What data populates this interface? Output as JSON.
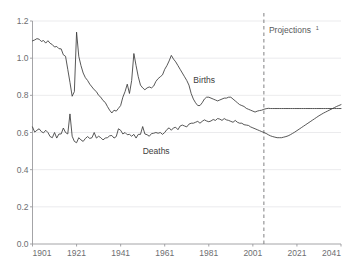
{
  "chart_data": {
    "type": "line",
    "title": "",
    "xlabel": "",
    "ylabel": "",
    "xlim": [
      1901,
      2041
    ],
    "ylim": [
      0.0,
      1.2
    ],
    "grid": true,
    "legend": "inline-labels",
    "x_ticks": [
      "1901",
      "1921",
      "1941",
      "1961",
      "1981",
      "2001",
      "2021",
      "2041"
    ],
    "x_tick_values": [
      1901,
      1921,
      1941,
      1961,
      1981,
      2001,
      2021,
      2041
    ],
    "y_ticks": [
      "0.0",
      "0.2",
      "0.4",
      "0.6",
      "0.8",
      "1.0",
      "1.2"
    ],
    "y_tick_values": [
      0.0,
      0.2,
      0.4,
      0.6,
      0.8,
      1.0,
      1.2
    ],
    "annotations": [
      {
        "name": "projection-divider",
        "label": "Projections",
        "superscript": "1",
        "x_value": 2006,
        "style": "dashed-vertical"
      }
    ],
    "series": [
      {
        "name": "Births",
        "label": "Births",
        "label_x_value": 1974,
        "label_y_value": 0.865,
        "color": "#3a3a3a",
        "x": [
          1901,
          1902,
          1903,
          1904,
          1905,
          1906,
          1907,
          1908,
          1909,
          1910,
          1911,
          1912,
          1913,
          1914,
          1915,
          1916,
          1917,
          1918,
          1919,
          1920,
          1921,
          1922,
          1923,
          1924,
          1925,
          1926,
          1927,
          1928,
          1929,
          1930,
          1931,
          1932,
          1933,
          1934,
          1935,
          1936,
          1937,
          1938,
          1939,
          1940,
          1941,
          1942,
          1943,
          1944,
          1945,
          1946,
          1947,
          1948,
          1949,
          1950,
          1951,
          1952,
          1953,
          1954,
          1955,
          1956,
          1957,
          1958,
          1959,
          1960,
          1961,
          1962,
          1963,
          1964,
          1965,
          1966,
          1967,
          1968,
          1969,
          1970,
          1971,
          1972,
          1973,
          1974,
          1975,
          1976,
          1977,
          1978,
          1979,
          1980,
          1981,
          1982,
          1983,
          1984,
          1985,
          1986,
          1987,
          1988,
          1989,
          1990,
          1991,
          1992,
          1993,
          1994,
          1995,
          1996,
          1997,
          1998,
          1999,
          2000,
          2001,
          2002,
          2003,
          2004,
          2005,
          2006,
          2007,
          2008,
          2009,
          2010,
          2011,
          2012,
          2013,
          2014,
          2015,
          2016,
          2017,
          2018,
          2019,
          2020,
          2021,
          2022,
          2023,
          2024,
          2025,
          2026,
          2027,
          2028,
          2029,
          2030,
          2031,
          2032,
          2033,
          2034,
          2035,
          2036,
          2037,
          2038,
          2039,
          2040,
          2041
        ],
        "values": [
          1.093,
          1.098,
          1.105,
          1.102,
          1.09,
          1.095,
          1.081,
          1.094,
          1.08,
          1.073,
          1.06,
          1.063,
          1.051,
          1.05,
          1.018,
          1.01,
          0.94,
          0.87,
          0.795,
          0.82,
          1.14,
          1.01,
          0.96,
          0.92,
          0.895,
          0.88,
          0.86,
          0.845,
          0.83,
          0.82,
          0.8,
          0.79,
          0.772,
          0.762,
          0.74,
          0.72,
          0.705,
          0.72,
          0.715,
          0.73,
          0.745,
          0.79,
          0.82,
          0.86,
          0.81,
          0.88,
          1.025,
          0.96,
          0.9,
          0.855,
          0.84,
          0.83,
          0.84,
          0.845,
          0.84,
          0.85,
          0.875,
          0.89,
          0.9,
          0.91,
          0.94,
          0.96,
          0.985,
          1.015,
          0.995,
          0.98,
          0.96,
          0.94,
          0.92,
          0.9,
          0.88,
          0.855,
          0.81,
          0.78,
          0.76,
          0.745,
          0.745,
          0.76,
          0.78,
          0.79,
          0.79,
          0.785,
          0.78,
          0.775,
          0.77,
          0.775,
          0.78,
          0.785,
          0.785,
          0.79,
          0.79,
          0.78,
          0.77,
          0.76,
          0.75,
          0.745,
          0.74,
          0.73,
          0.725,
          0.72,
          0.715,
          0.71,
          0.715,
          0.718,
          0.72,
          0.725,
          0.728,
          0.73,
          0.729,
          0.729,
          0.729,
          0.729,
          0.729,
          0.729,
          0.729,
          0.729,
          0.729,
          0.729,
          0.729,
          0.729,
          0.729,
          0.729,
          0.729,
          0.729,
          0.729,
          0.729,
          0.729,
          0.729,
          0.729,
          0.729,
          0.729,
          0.729,
          0.729,
          0.729,
          0.729,
          0.729,
          0.729,
          0.729,
          0.729,
          0.729,
          0.729
        ]
      },
      {
        "name": "Deaths",
        "label": "Deaths",
        "label_x_value": 1951,
        "label_y_value": 0.485,
        "color": "#3a3a3a",
        "x": [
          1901,
          1902,
          1903,
          1904,
          1905,
          1906,
          1907,
          1908,
          1909,
          1910,
          1911,
          1912,
          1913,
          1914,
          1915,
          1916,
          1917,
          1918,
          1919,
          1920,
          1921,
          1922,
          1923,
          1924,
          1925,
          1926,
          1927,
          1928,
          1929,
          1930,
          1931,
          1932,
          1933,
          1934,
          1935,
          1936,
          1937,
          1938,
          1939,
          1940,
          1941,
          1942,
          1943,
          1944,
          1945,
          1946,
          1947,
          1948,
          1949,
          1950,
          1951,
          1952,
          1953,
          1954,
          1955,
          1956,
          1957,
          1958,
          1959,
          1960,
          1961,
          1962,
          1963,
          1964,
          1965,
          1966,
          1967,
          1968,
          1969,
          1970,
          1971,
          1972,
          1973,
          1974,
          1975,
          1976,
          1977,
          1978,
          1979,
          1980,
          1981,
          1982,
          1983,
          1984,
          1985,
          1986,
          1987,
          1988,
          1989,
          1990,
          1991,
          1992,
          1993,
          1994,
          1995,
          1996,
          1997,
          1998,
          1999,
          2000,
          2001,
          2002,
          2003,
          2004,
          2005,
          2006,
          2007,
          2008,
          2009,
          2010,
          2011,
          2012,
          2013,
          2014,
          2015,
          2016,
          2017,
          2018,
          2019,
          2020,
          2021,
          2022,
          2023,
          2024,
          2025,
          2026,
          2027,
          2028,
          2029,
          2030,
          2031,
          2032,
          2033,
          2034,
          2035,
          2036,
          2037,
          2038,
          2039,
          2040,
          2041
        ],
        "values": [
          0.63,
          0.602,
          0.612,
          0.62,
          0.605,
          0.598,
          0.612,
          0.6,
          0.578,
          0.572,
          0.6,
          0.57,
          0.592,
          0.592,
          0.624,
          0.6,
          0.592,
          0.7,
          0.58,
          0.552,
          0.545,
          0.572,
          0.56,
          0.552,
          0.568,
          0.578,
          0.568,
          0.572,
          0.6,
          0.57,
          0.58,
          0.572,
          0.56,
          0.57,
          0.572,
          0.582,
          0.584,
          0.57,
          0.578,
          0.62,
          0.612,
          0.592,
          0.6,
          0.588,
          0.59,
          0.58,
          0.59,
          0.57,
          0.59,
          0.59,
          0.632,
          0.592,
          0.588,
          0.58,
          0.594,
          0.596,
          0.6,
          0.596,
          0.6,
          0.59,
          0.6,
          0.616,
          0.625,
          0.612,
          0.625,
          0.628,
          0.615,
          0.635,
          0.64,
          0.635,
          0.63,
          0.645,
          0.65,
          0.65,
          0.655,
          0.66,
          0.65,
          0.66,
          0.668,
          0.662,
          0.658,
          0.662,
          0.67,
          0.665,
          0.675,
          0.672,
          0.665,
          0.675,
          0.668,
          0.665,
          0.66,
          0.655,
          0.665,
          0.655,
          0.65,
          0.65,
          0.642,
          0.64,
          0.638,
          0.63,
          0.625,
          0.62,
          0.615,
          0.61,
          0.605,
          0.6,
          0.595,
          0.588,
          0.582,
          0.578,
          0.575,
          0.572,
          0.572,
          0.572,
          0.575,
          0.578,
          0.582,
          0.588,
          0.595,
          0.602,
          0.61,
          0.618,
          0.626,
          0.634,
          0.642,
          0.65,
          0.658,
          0.666,
          0.674,
          0.682,
          0.69,
          0.697,
          0.704,
          0.71,
          0.716,
          0.722,
          0.728,
          0.734,
          0.74,
          0.745,
          0.75
        ]
      }
    ]
  }
}
